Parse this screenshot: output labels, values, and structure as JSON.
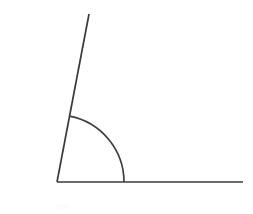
{
  "figure": {
    "type": "geometry-diagram",
    "background_color": "#ffffff",
    "stroke_color": "#3a3a3a",
    "arc_color": "#3f3f3f",
    "stroke_width": 1.7,
    "canvas": {
      "width": 253,
      "height": 214
    },
    "vertex": {
      "x": 57,
      "y": 182,
      "label": ""
    },
    "rays": [
      {
        "name": "horizontal-ray",
        "from": {
          "x": 57,
          "y": 182
        },
        "to": {
          "x": 243,
          "y": 182
        },
        "angle_degrees": 0,
        "length": 186
      },
      {
        "name": "slanted-ray",
        "from": {
          "x": 57,
          "y": 182
        },
        "to": {
          "x": 89,
          "y": 14
        },
        "angle_degrees": 100.8,
        "length": 171
      }
    ],
    "angle_arc": {
      "name": "angle-marker-arc",
      "center": {
        "x": 57,
        "y": 182
      },
      "radius": 67,
      "start_angle_degrees": 0,
      "end_angle_degrees": 100.8,
      "sweep_degrees": 100.8,
      "start_point": {
        "x": 124,
        "y": 182
      },
      "end_point": {
        "x": 69.4,
        "y": 116.2
      },
      "path": "M 124 182 A 67 67 0 0 0 69.40 116.20"
    },
    "measure": {
      "angle_degrees": 100.8,
      "classification": "obtuse",
      "label_text": ""
    },
    "artifact": {
      "name": "faint-smudge",
      "x": 55,
      "y": 204,
      "width": 13,
      "height": 5,
      "color": "#fcfcfc"
    }
  }
}
